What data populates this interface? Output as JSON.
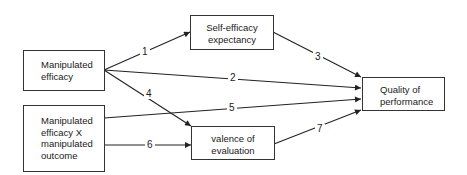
{
  "diagram": {
    "type": "path-diagram",
    "nodes": [
      {
        "id": "manipulated_efficacy",
        "lines": [
          "Manipulated",
          "efficacy"
        ]
      },
      {
        "id": "interaction",
        "lines": [
          "Manipulated",
          "efficacy X",
          "manipulated",
          "outcome"
        ]
      },
      {
        "id": "self_efficacy",
        "lines": [
          "Self-efficacy",
          "expectancy"
        ]
      },
      {
        "id": "valence",
        "lines": [
          "valence of",
          "evaluation"
        ]
      },
      {
        "id": "quality",
        "lines": [
          "Quality of",
          "performance"
        ]
      }
    ],
    "edges": [
      {
        "label": "1",
        "from": "manipulated_efficacy",
        "to": "self_efficacy"
      },
      {
        "label": "2",
        "from": "manipulated_efficacy",
        "to": "quality"
      },
      {
        "label": "3",
        "from": "self_efficacy",
        "to": "quality"
      },
      {
        "label": "4",
        "from": "manipulated_efficacy",
        "to": "valence"
      },
      {
        "label": "5",
        "from": "interaction",
        "to": "quality"
      },
      {
        "label": "6",
        "from": "interaction",
        "to": "valence"
      },
      {
        "label": "7",
        "from": "valence",
        "to": "quality"
      }
    ],
    "colors": {
      "line": "#222222",
      "box_border": "#333333",
      "background": "#ffffff"
    }
  }
}
